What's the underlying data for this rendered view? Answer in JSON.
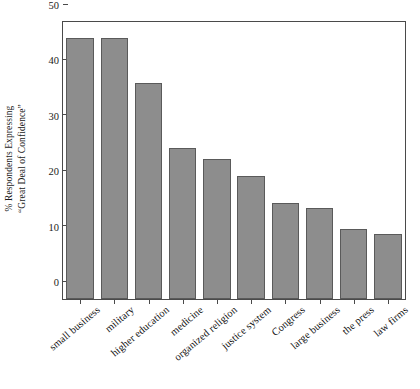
{
  "chart_data": {
    "type": "bar",
    "title": "",
    "subtitle": "",
    "xlabel": "",
    "ylabel": "% Respondents Expressing\n“Great Deal of Confidence”",
    "categories": [
      "small business",
      "military",
      "higher education",
      "medicine",
      "organized religion",
      "justice system",
      "Congress",
      "large business",
      "the press",
      "law firms"
    ],
    "values": [
      47.2,
      47.2,
      39.0,
      27.2,
      25.2,
      22.2,
      17.4,
      16.4,
      12.6,
      11.7
    ],
    "ylim": [
      0,
      50
    ],
    "yticks": [
      0,
      10,
      20,
      30,
      40,
      50
    ],
    "ytick_labels": [
      "0",
      "10",
      "20",
      "30",
      "40",
      "50"
    ],
    "grid": false,
    "legend": null,
    "bar_color": "#8d8d8d",
    "bar_edge_color": "#5a5a5a",
    "axis_color": "#4a4a4a",
    "text_color": "#111111",
    "background": "#ffffff"
  }
}
